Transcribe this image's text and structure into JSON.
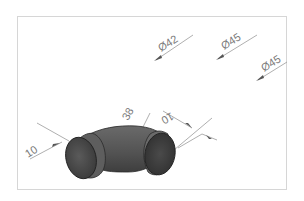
{
  "drawing": {
    "subject": "90° pipe elbow",
    "colors": {
      "background": "#ffffff",
      "frame": "#d6d6d6",
      "dimension_line": "#9a9a9a",
      "dimension_text": "#7a7a7a",
      "body_dark": "#3c3c3c",
      "body_mid": "#555555",
      "body_light": "#6e6e6e"
    },
    "dimensions": {
      "dia_1": "Ø42",
      "dia_2": "Ø45",
      "dia_3": "Ø45",
      "socket_left": "10",
      "socket_right": "10",
      "center": "38"
    }
  }
}
